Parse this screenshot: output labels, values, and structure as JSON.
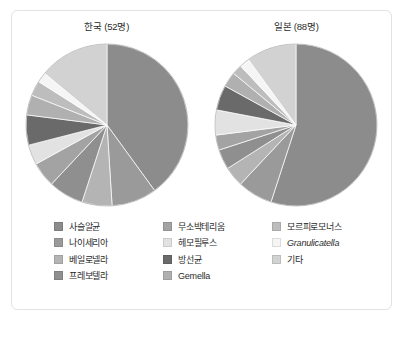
{
  "figure": {
    "charts": [
      {
        "title": "한국 (52명)",
        "n": 52
      },
      {
        "title": "일본 (88명)",
        "n": 88
      }
    ]
  },
  "legend": {
    "columns": [
      {
        "items": [
          {
            "label": "사슬알균",
            "color": "#8c8c8c"
          },
          {
            "label": "나이세리아",
            "color": "#9a9a9a"
          },
          {
            "label": "베일로넬라",
            "color": "#b4b4b4"
          },
          {
            "label": "프레보텔라",
            "color": "#8f8f8f"
          }
        ]
      },
      {
        "items": [
          {
            "label": "무소박테리움",
            "color": "#a3a3a3"
          },
          {
            "label": "헤모필루스",
            "color": "#e2e2e2"
          },
          {
            "label": "방선균",
            "color": "#6a6a6a"
          },
          {
            "label": "Gemella",
            "color": "#b0b0b0",
            "italic": false
          }
        ]
      },
      {
        "items": [
          {
            "label": "모르피로모너스",
            "color": "#bdbdbd"
          },
          {
            "label": "Granulicatella",
            "color": "#f5f5f5",
            "italic": true
          },
          {
            "label": "기타",
            "color": "#d2d2d2"
          }
        ]
      }
    ]
  },
  "chart_data": [
    {
      "type": "pie",
      "title": "한국 (52명)",
      "legend_position": "bottom",
      "labels": [
        "사슬알균",
        "나이세리아",
        "베일로넬라",
        "프레보텔라",
        "무소박테리움",
        "헤모필루스",
        "방선균",
        "Gemella",
        "모르피로모너스",
        "Granulicatella",
        "기타"
      ],
      "values": [
        40,
        9,
        6,
        7,
        5,
        4,
        6,
        4,
        3,
        2,
        14
      ],
      "colors": [
        "#8c8c8c",
        "#9a9a9a",
        "#b4b4b4",
        "#8f8f8f",
        "#a3a3a3",
        "#e2e2e2",
        "#6a6a6a",
        "#b0b0b0",
        "#bdbdbd",
        "#f5f5f5",
        "#d2d2d2"
      ],
      "units": "percent",
      "start_angle_deg": 0,
      "direction": "clockwise"
    },
    {
      "type": "pie",
      "title": "일본 (88명)",
      "legend_position": "bottom",
      "labels": [
        "사슬알균",
        "나이세리아",
        "베일로넬라",
        "프레보텔라",
        "무소박테리움",
        "헤모필루스",
        "방선균",
        "Gemella",
        "모르피로모너스",
        "Granulicatella",
        "기타"
      ],
      "values": [
        55,
        7,
        4,
        4,
        3,
        5,
        5,
        3,
        2,
        2,
        10
      ],
      "colors": [
        "#8c8c8c",
        "#9a9a9a",
        "#b4b4b4",
        "#8f8f8f",
        "#a3a3a3",
        "#e2e2e2",
        "#6a6a6a",
        "#b0b0b0",
        "#bdbdbd",
        "#f5f5f5",
        "#d2d2d2"
      ],
      "units": "percent",
      "start_angle_deg": 0,
      "direction": "clockwise"
    }
  ]
}
